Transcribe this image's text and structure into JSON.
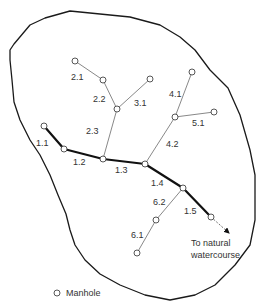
{
  "diagram": {
    "outline_points": [
      [
        10,
        50
      ],
      [
        14,
        44
      ],
      [
        30,
        25
      ],
      [
        45,
        18
      ],
      [
        70,
        11
      ],
      [
        130,
        17
      ],
      [
        160,
        25
      ],
      [
        180,
        37
      ],
      [
        195,
        50
      ],
      [
        210,
        70
      ],
      [
        228,
        88
      ],
      [
        240,
        115
      ],
      [
        250,
        150
      ],
      [
        255,
        175
      ],
      [
        255,
        220
      ],
      [
        250,
        245
      ],
      [
        235,
        265
      ],
      [
        215,
        285
      ],
      [
        195,
        295
      ],
      [
        170,
        300
      ],
      [
        145,
        295
      ],
      [
        120,
        285
      ],
      [
        100,
        274
      ],
      [
        85,
        260
      ],
      [
        75,
        245
      ],
      [
        70,
        230
      ],
      [
        66,
        214
      ],
      [
        58,
        195
      ],
      [
        50,
        175
      ],
      [
        40,
        155
      ],
      [
        30,
        140
      ],
      [
        20,
        120
      ],
      [
        14,
        102
      ],
      [
        12,
        80
      ],
      [
        10,
        60
      ]
    ],
    "manholes": [
      {
        "id": "m-2.1-start",
        "x": 75,
        "y": 61
      },
      {
        "id": "m-2.1-2.2",
        "x": 103,
        "y": 80
      },
      {
        "id": "m-3.1-start",
        "x": 150,
        "y": 79
      },
      {
        "id": "m-2.2-2.3",
        "x": 117,
        "y": 109
      },
      {
        "id": "m-1.1-start",
        "x": 44,
        "y": 126
      },
      {
        "id": "m-1.1-1.2",
        "x": 64,
        "y": 149
      },
      {
        "id": "m-1.2-1.3",
        "x": 103,
        "y": 159
      },
      {
        "id": "m-1.3-1.4",
        "x": 145,
        "y": 164
      },
      {
        "id": "m-4.1-start",
        "x": 192,
        "y": 72
      },
      {
        "id": "m-4.1-4.2",
        "x": 175,
        "y": 117
      },
      {
        "id": "m-5.1-start",
        "x": 214,
        "y": 112
      },
      {
        "id": "m-1.4-1.5",
        "x": 183,
        "y": 188
      },
      {
        "id": "m-1.5-end",
        "x": 211,
        "y": 217
      },
      {
        "id": "m-6.1-6.2",
        "x": 156,
        "y": 220
      },
      {
        "id": "m-6.1-start",
        "x": 137,
        "y": 253
      }
    ],
    "pipes": [
      {
        "label": "1.1",
        "type": "trunk",
        "from": [
          44,
          126
        ],
        "to": [
          64,
          149
        ],
        "label_x": 36,
        "label_y": 146
      },
      {
        "label": "1.2",
        "type": "trunk",
        "from": [
          64,
          149
        ],
        "to": [
          103,
          159
        ],
        "label_x": 73,
        "label_y": 165
      },
      {
        "label": "1.3",
        "type": "trunk",
        "from": [
          103,
          159
        ],
        "to": [
          145,
          164
        ],
        "label_x": 115,
        "label_y": 173
      },
      {
        "label": "1.4",
        "type": "trunk",
        "from": [
          145,
          164
        ],
        "to": [
          183,
          188
        ],
        "label_x": 151,
        "label_y": 186
      },
      {
        "label": "1.5",
        "type": "trunk",
        "from": [
          183,
          188
        ],
        "to": [
          211,
          217
        ],
        "label_x": 184,
        "label_y": 214
      },
      {
        "label": "2.1",
        "type": "branch",
        "from": [
          75,
          61
        ],
        "to": [
          103,
          80
        ],
        "label_x": 71,
        "label_y": 80
      },
      {
        "label": "2.2",
        "type": "branch",
        "from": [
          103,
          80
        ],
        "to": [
          117,
          109
        ],
        "label_x": 93,
        "label_y": 102
      },
      {
        "label": "2.3",
        "type": "branch",
        "from": [
          117,
          109
        ],
        "to": [
          103,
          159
        ],
        "label_x": 86,
        "label_y": 134
      },
      {
        "label": "3.1",
        "type": "branch",
        "from": [
          150,
          79
        ],
        "to": [
          117,
          109
        ],
        "label_x": 134,
        "label_y": 106
      },
      {
        "label": "4.1",
        "type": "branch",
        "from": [
          192,
          72
        ],
        "to": [
          175,
          117
        ],
        "label_x": 169,
        "label_y": 97
      },
      {
        "label": "4.2",
        "type": "branch",
        "from": [
          175,
          117
        ],
        "to": [
          145,
          164
        ],
        "label_x": 166,
        "label_y": 147
      },
      {
        "label": "5.1",
        "type": "branch",
        "from": [
          214,
          112
        ],
        "to": [
          175,
          117
        ],
        "label_x": 192,
        "label_y": 126
      },
      {
        "label": "6.1",
        "type": "branch",
        "from": [
          137,
          253
        ],
        "to": [
          156,
          220
        ],
        "label_x": 131,
        "label_y": 238
      },
      {
        "label": "6.2",
        "type": "branch",
        "from": [
          156,
          220
        ],
        "to": [
          183,
          188
        ],
        "label_x": 153,
        "label_y": 205
      }
    ],
    "outlet": {
      "from": [
        211,
        217
      ],
      "to": [
        229,
        233
      ],
      "label_line1": "To natural",
      "label_line2": "watercourse",
      "label_x": 191,
      "label_y1": 246,
      "label_y2": 258
    },
    "legend": {
      "symbol": "manhole-circle",
      "label": "Manhole",
      "x": 57,
      "y": 293
    }
  }
}
